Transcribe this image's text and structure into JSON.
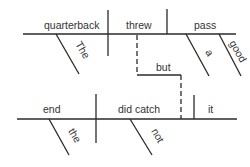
{
  "diagram": {
    "type": "sentence-diagram",
    "sentence": "The quarterback threw a good pass but the end did not catch it.",
    "clause1": {
      "subject": "quarterback",
      "verb": "threw",
      "object": "pass",
      "modifiers": {
        "subject": [
          "The"
        ],
        "object": [
          "a",
          "good"
        ]
      }
    },
    "conjunction": "but",
    "clause2": {
      "subject": "end",
      "verb": "did catch",
      "object": "it",
      "modifiers": {
        "subject": [
          "the"
        ],
        "verb": [
          "not"
        ]
      }
    },
    "colors": {
      "line": "#2a2a2a",
      "text": "#333333",
      "background": "#ffffff"
    }
  }
}
